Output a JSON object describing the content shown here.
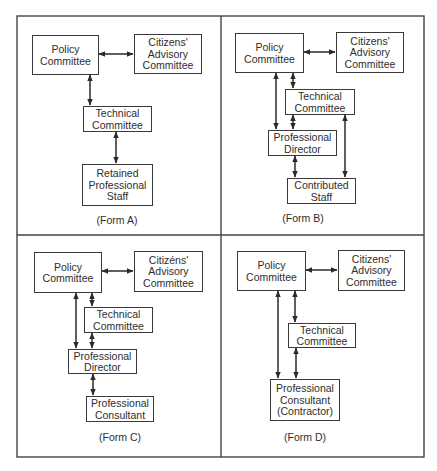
{
  "figure": {
    "panels": [
      {
        "id": "form-a",
        "label": "(Form A)",
        "boxes": {
          "policy": [
            "Policy",
            "Committee"
          ],
          "citizens": [
            "Citizens'",
            "Advisory",
            "Committee"
          ],
          "technical": [
            "Technical",
            "Committee"
          ],
          "retained": [
            "Retained",
            "Professional",
            "Staff"
          ]
        },
        "connections": [
          {
            "from": "policy",
            "to": "citizens",
            "type": "bidirectional"
          },
          {
            "from": "policy",
            "to": "technical",
            "type": "bidirectional"
          },
          {
            "from": "technical",
            "to": "retained",
            "type": "bidirectional"
          }
        ]
      },
      {
        "id": "form-b",
        "label": "(Form B)",
        "boxes": {
          "policy": [
            "Policy",
            "Committee"
          ],
          "citizens": [
            "Citizens'",
            "Advisory",
            "Committee"
          ],
          "technical": [
            "Technical",
            "Committee"
          ],
          "director": [
            "Professional",
            "Director"
          ],
          "contributed": [
            "Contributed",
            "Staff"
          ]
        },
        "connections": [
          {
            "from": "policy",
            "to": "citizens",
            "type": "bidirectional"
          },
          {
            "from": "policy",
            "to": "director",
            "type": "bidirectional"
          },
          {
            "from": "policy",
            "to": "technical",
            "type": "bidirectional"
          },
          {
            "from": "technical",
            "to": "director",
            "type": "bidirectional"
          },
          {
            "from": "technical",
            "to": "contributed",
            "type": "bidirectional"
          },
          {
            "from": "director",
            "to": "contributed",
            "type": "bidirectional"
          }
        ]
      },
      {
        "id": "form-c",
        "label": "(Form C)",
        "boxes": {
          "policy": [
            "Policy",
            "Committee"
          ],
          "citizens": [
            "Citizéns'",
            "Advisory",
            "Committee"
          ],
          "technical": [
            "Technical",
            "Committee"
          ],
          "director": [
            "Professional",
            "Director"
          ],
          "consultant": [
            "Professional",
            "Consultant"
          ]
        },
        "connections": [
          {
            "from": "policy",
            "to": "citizens",
            "type": "bidirectional"
          },
          {
            "from": "policy",
            "to": "director",
            "type": "bidirectional"
          },
          {
            "from": "policy",
            "to": "technical",
            "type": "bidirectional"
          },
          {
            "from": "technical",
            "to": "director",
            "type": "bidirectional"
          },
          {
            "from": "director",
            "to": "consultant",
            "type": "bidirectional"
          }
        ]
      },
      {
        "id": "form-d",
        "label": "(Form D)",
        "boxes": {
          "policy": [
            "Policy",
            "Committee"
          ],
          "citizens": [
            "Citizens'",
            "Advisory",
            "Committee"
          ],
          "technical": [
            "Technical",
            "Committee"
          ],
          "consultant": [
            "Professional",
            "Consultant",
            "(Contractor)"
          ]
        },
        "connections": [
          {
            "from": "policy",
            "to": "citizens",
            "type": "bidirectional"
          },
          {
            "from": "policy",
            "to": "consultant",
            "type": "bidirectional"
          },
          {
            "from": "policy",
            "to": "technical",
            "type": "bidirectional"
          },
          {
            "from": "technical",
            "to": "consultant",
            "type": "bidirectional"
          }
        ]
      }
    ]
  }
}
